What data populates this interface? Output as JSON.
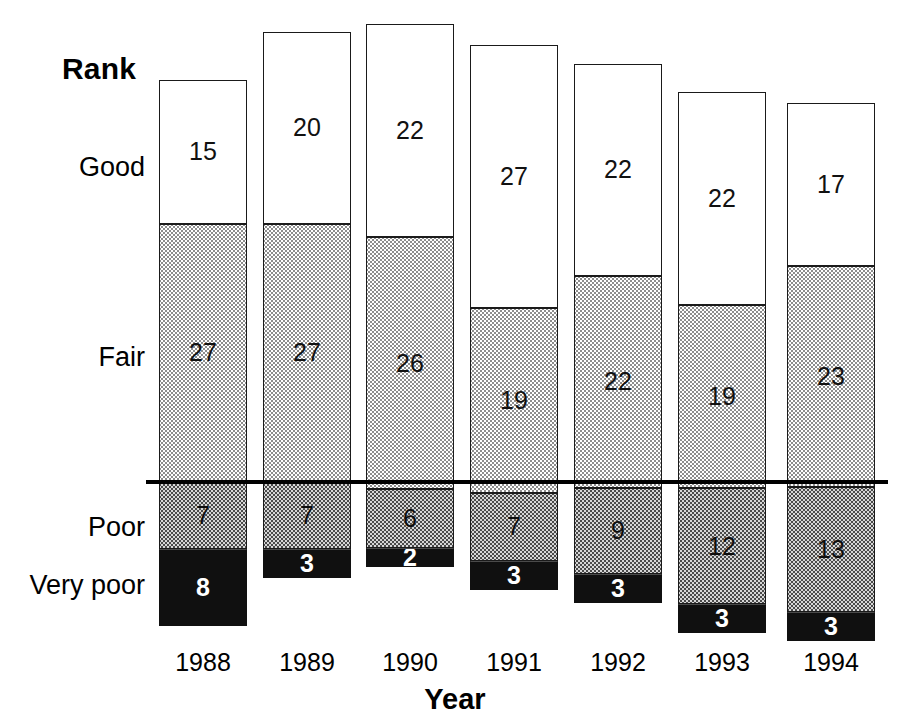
{
  "chart_data": {
    "type": "bar",
    "subtype": "stacked-bar",
    "title": "",
    "xlabel": "Year",
    "ylabel": "Rank",
    "categories": [
      "1988",
      "1989",
      "1990",
      "1991",
      "1992",
      "1993",
      "1994"
    ],
    "series": [
      {
        "name": "Good",
        "values": [
          15,
          20,
          22,
          27,
          22,
          22,
          17
        ]
      },
      {
        "name": "Fair",
        "values": [
          27,
          27,
          26,
          19,
          22,
          19,
          23
        ]
      },
      {
        "name": "Poor",
        "values": [
          7,
          7,
          6,
          7,
          9,
          12,
          13
        ]
      },
      {
        "name": "Very poor",
        "values": [
          8,
          3,
          2,
          3,
          3,
          3,
          3
        ]
      }
    ],
    "stack_order_top_to_bottom": [
      "Good",
      "Fair",
      "Poor",
      "Very poor"
    ],
    "totals": [
      57,
      57,
      56,
      56,
      56,
      56,
      56
    ],
    "grid": false,
    "legend": "none",
    "rank_labels": [
      "Good",
      "Fair",
      "Poor",
      "Very poor"
    ],
    "annotations": [
      {
        "name": "reference-line",
        "description": "horizontal rule separating Fair from Poor"
      }
    ]
  },
  "axes": {
    "rank_title": "Rank",
    "year_title": "Year"
  },
  "colors": {
    "good": "#ffffff",
    "fair": "#bfbfbf",
    "poor": "#6e6e6e",
    "very_poor": "#101010",
    "outline": "#1a1a1a",
    "reference_line": "#000000"
  }
}
